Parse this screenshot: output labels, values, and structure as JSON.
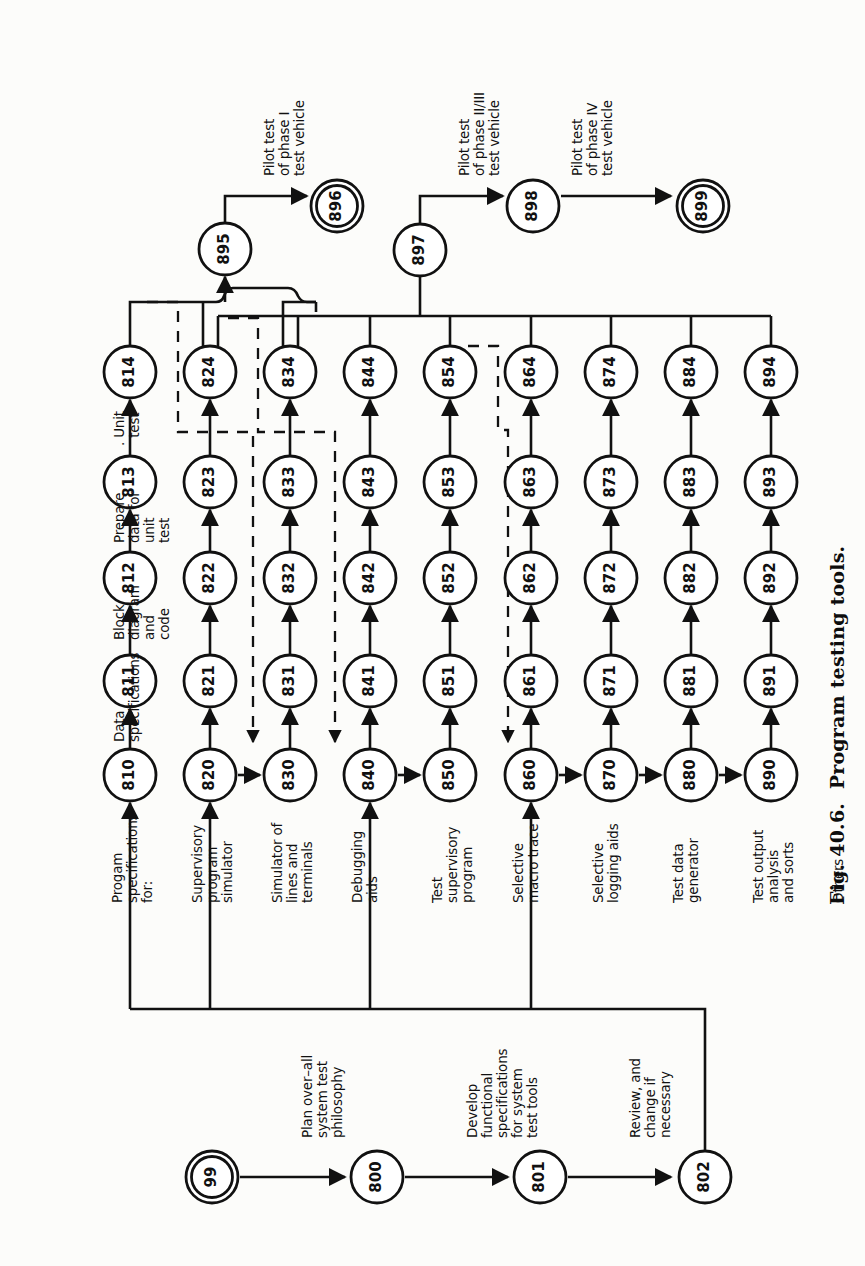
{
  "figure": {
    "caption": "Fig. 40.6.  Program testing tools.",
    "kind": "PERT network / activity-on-arrow diagram",
    "orientation": "rotated 90 degrees counter-clockwise on the page"
  },
  "colors": {
    "ink": "#111111",
    "paper": "#fcfcfa",
    "line": "#111111",
    "dashed": "#111111"
  },
  "nodes": [
    {
      "id": "99",
      "label": "99",
      "x": 212,
      "y": 1177,
      "r": 26,
      "double": true
    },
    {
      "id": "800",
      "label": "800",
      "x": 377,
      "y": 1177,
      "r": 26,
      "double": false
    },
    {
      "id": "801",
      "label": "801",
      "x": 540,
      "y": 1177,
      "r": 26,
      "double": false
    },
    {
      "id": "802",
      "label": "802",
      "x": 705,
      "y": 1177,
      "r": 26,
      "double": false
    },
    {
      "id": "810",
      "label": "810",
      "x": 130,
      "y": 775,
      "r": 26,
      "double": false
    },
    {
      "id": "811",
      "label": "811",
      "x": 130,
      "y": 681,
      "r": 26,
      "double": false
    },
    {
      "id": "812",
      "label": "812",
      "x": 130,
      "y": 578,
      "r": 26,
      "double": false
    },
    {
      "id": "813",
      "label": "813",
      "x": 130,
      "y": 482,
      "r": 26,
      "double": false
    },
    {
      "id": "814",
      "label": "814",
      "x": 130,
      "y": 372,
      "r": 26,
      "double": false
    },
    {
      "id": "820",
      "label": "820",
      "x": 210,
      "y": 775,
      "r": 26,
      "double": false
    },
    {
      "id": "821",
      "label": "821",
      "x": 210,
      "y": 681,
      "r": 26,
      "double": false
    },
    {
      "id": "822",
      "label": "822",
      "x": 210,
      "y": 578,
      "r": 26,
      "double": false
    },
    {
      "id": "823",
      "label": "823",
      "x": 210,
      "y": 482,
      "r": 26,
      "double": false
    },
    {
      "id": "824",
      "label": "824",
      "x": 210,
      "y": 372,
      "r": 26,
      "double": false
    },
    {
      "id": "830",
      "label": "830",
      "x": 290,
      "y": 775,
      "r": 26,
      "double": false
    },
    {
      "id": "831",
      "label": "831",
      "x": 290,
      "y": 681,
      "r": 26,
      "double": false
    },
    {
      "id": "832",
      "label": "832",
      "x": 290,
      "y": 578,
      "r": 26,
      "double": false
    },
    {
      "id": "833",
      "label": "833",
      "x": 290,
      "y": 482,
      "r": 26,
      "double": false
    },
    {
      "id": "834",
      "label": "834",
      "x": 290,
      "y": 372,
      "r": 26,
      "double": false
    },
    {
      "id": "840",
      "label": "840",
      "x": 370,
      "y": 775,
      "r": 26,
      "double": false
    },
    {
      "id": "841",
      "label": "841",
      "x": 370,
      "y": 681,
      "r": 26,
      "double": false
    },
    {
      "id": "842",
      "label": "842",
      "x": 370,
      "y": 578,
      "r": 26,
      "double": false
    },
    {
      "id": "843",
      "label": "843",
      "x": 370,
      "y": 482,
      "r": 26,
      "double": false
    },
    {
      "id": "844",
      "label": "844",
      "x": 370,
      "y": 372,
      "r": 26,
      "double": false
    },
    {
      "id": "850",
      "label": "850",
      "x": 450,
      "y": 775,
      "r": 26,
      "double": false
    },
    {
      "id": "851",
      "label": "851",
      "x": 450,
      "y": 681,
      "r": 26,
      "double": false
    },
    {
      "id": "852",
      "label": "852",
      "x": 450,
      "y": 578,
      "r": 26,
      "double": false
    },
    {
      "id": "853",
      "label": "853",
      "x": 450,
      "y": 482,
      "r": 26,
      "double": false
    },
    {
      "id": "854",
      "label": "854",
      "x": 450,
      "y": 372,
      "r": 26,
      "double": false
    },
    {
      "id": "860",
      "label": "860",
      "x": 531,
      "y": 775,
      "r": 26,
      "double": false
    },
    {
      "id": "861",
      "label": "861",
      "x": 531,
      "y": 681,
      "r": 26,
      "double": false
    },
    {
      "id": "862",
      "label": "862",
      "x": 531,
      "y": 578,
      "r": 26,
      "double": false
    },
    {
      "id": "863",
      "label": "863",
      "x": 531,
      "y": 482,
      "r": 26,
      "double": false
    },
    {
      "id": "864",
      "label": "864",
      "x": 531,
      "y": 372,
      "r": 26,
      "double": false
    },
    {
      "id": "870",
      "label": "870",
      "x": 611,
      "y": 775,
      "r": 26,
      "double": false
    },
    {
      "id": "871",
      "label": "871",
      "x": 611,
      "y": 681,
      "r": 26,
      "double": false
    },
    {
      "id": "872",
      "label": "872",
      "x": 611,
      "y": 578,
      "r": 26,
      "double": false
    },
    {
      "id": "873",
      "label": "873",
      "x": 611,
      "y": 482,
      "r": 26,
      "double": false
    },
    {
      "id": "874",
      "label": "874",
      "x": 611,
      "y": 372,
      "r": 26,
      "double": false
    },
    {
      "id": "880",
      "label": "880",
      "x": 691,
      "y": 775,
      "r": 26,
      "double": false
    },
    {
      "id": "881",
      "label": "881",
      "x": 691,
      "y": 681,
      "r": 26,
      "double": false
    },
    {
      "id": "882",
      "label": "882",
      "x": 691,
      "y": 578,
      "r": 26,
      "double": false
    },
    {
      "id": "883",
      "label": "883",
      "x": 691,
      "y": 482,
      "r": 26,
      "double": false
    },
    {
      "id": "884",
      "label": "884",
      "x": 691,
      "y": 372,
      "r": 26,
      "double": false
    },
    {
      "id": "890",
      "label": "890",
      "x": 771,
      "y": 775,
      "r": 26,
      "double": false
    },
    {
      "id": "891",
      "label": "891",
      "x": 771,
      "y": 681,
      "r": 26,
      "double": false
    },
    {
      "id": "892",
      "label": "892",
      "x": 771,
      "y": 578,
      "r": 26,
      "double": false
    },
    {
      "id": "893",
      "label": "893",
      "x": 771,
      "y": 482,
      "r": 26,
      "double": false
    },
    {
      "id": "894",
      "label": "894",
      "x": 771,
      "y": 372,
      "r": 26,
      "double": false
    },
    {
      "id": "895",
      "label": "895",
      "x": 225,
      "y": 249,
      "r": 26,
      "double": false
    },
    {
      "id": "896",
      "label": "896",
      "x": 337,
      "y": 206,
      "r": 26,
      "double": true
    },
    {
      "id": "897",
      "label": "897",
      "x": 420,
      "y": 250,
      "r": 26,
      "double": false
    },
    {
      "id": "898",
      "label": "898",
      "x": 533,
      "y": 206,
      "r": 26,
      "double": false
    },
    {
      "id": "899",
      "label": "899",
      "x": 703,
      "y": 206,
      "r": 26,
      "double": true
    }
  ],
  "activity_labels": [
    {
      "id": "plan-philosophy",
      "text": "Plan over–all\nsystem test\nphilosophy",
      "x": 300,
      "y": 1138,
      "size": 13.5
    },
    {
      "id": "develop-specs",
      "text": "Develop\nfunctional\nspecifications\nfor system\ntest tools",
      "x": 465,
      "y": 1138,
      "size": 13.5
    },
    {
      "id": "review-change",
      "text": "Review, and\nchange if\nnecessary",
      "x": 628,
      "y": 1138,
      "size": 13.5
    },
    {
      "id": "prog-spec-for",
      "text": "Progam\nspecifications\nfor:",
      "x": 110,
      "y": 903,
      "size": 13.5
    },
    {
      "id": "supervisory-sim",
      "text": "Supervisory\nprogram\nsimulator",
      "x": 190,
      "y": 903,
      "size": 13.5
    },
    {
      "id": "simulator-lines",
      "text": "Simulator of\nlines and\nterminals",
      "x": 270,
      "y": 903,
      "size": 13.5
    },
    {
      "id": "debugging-aids",
      "text": "Debugging\naids",
      "x": 350,
      "y": 903,
      "size": 13.5
    },
    {
      "id": "test-supervisory",
      "text": "Test\nsupervisory\nprogram",
      "x": 430,
      "y": 903,
      "size": 13.5
    },
    {
      "id": "selective-macro",
      "text": "Selective\nmacro trace",
      "x": 511,
      "y": 903,
      "size": 13.5
    },
    {
      "id": "selective-log",
      "text": "Selective\nlogging aids",
      "x": 591,
      "y": 903,
      "size": 13.5
    },
    {
      "id": "test-data-gen",
      "text": "Test data\ngenerator",
      "x": 671,
      "y": 903,
      "size": 13.5
    },
    {
      "id": "test-output",
      "text": "Test output\nanalysis\nand sorts",
      "x": 751,
      "y": 903,
      "size": 13.5
    },
    {
      "id": "others",
      "text": "Others",
      "x": 831,
      "y": 903,
      "size": 13.5
    },
    {
      "id": "data-specs",
      "text": "Data\nspecifications",
      "x": 112,
      "y": 742,
      "size": 13.5
    },
    {
      "id": "block-diagram",
      "text": "Block\ndiagram\nand\ncode",
      "x": 112,
      "y": 640,
      "size": 13.5
    },
    {
      "id": "prepare-data",
      "text": "Prepare\ndata for\nunit\ntest",
      "x": 112,
      "y": 543,
      "size": 13.5
    },
    {
      "id": "unit-test",
      "text": ". Unit\n  test",
      "x": 112,
      "y": 446,
      "size": 13.5
    },
    {
      "id": "pilot-phase-1",
      "text": "Pilot test\nof phase I\ntest vehicle",
      "x": 262,
      "y": 176,
      "size": 13.5
    },
    {
      "id": "pilot-phase-23",
      "text": "Pilot test\nof phase II/III\ntest vehicle",
      "x": 457,
      "y": 176,
      "size": 13.5
    },
    {
      "id": "pilot-phase-4",
      "text": "Pilot test\nof phase IV\ntest vehicle",
      "x": 570,
      "y": 176,
      "size": 13.5
    }
  ],
  "edges": {
    "solid_chains": [
      [
        "99",
        "800"
      ],
      [
        "800",
        "801"
      ],
      [
        "801",
        "802"
      ],
      [
        "810",
        "811"
      ],
      [
        "811",
        "812"
      ],
      [
        "812",
        "813"
      ],
      [
        "813",
        "814"
      ],
      [
        "820",
        "821"
      ],
      [
        "821",
        "822"
      ],
      [
        "822",
        "823"
      ],
      [
        "823",
        "824"
      ],
      [
        "830",
        "831"
      ],
      [
        "831",
        "832"
      ],
      [
        "832",
        "833"
      ],
      [
        "833",
        "834"
      ],
      [
        "840",
        "841"
      ],
      [
        "841",
        "842"
      ],
      [
        "842",
        "843"
      ],
      [
        "843",
        "844"
      ],
      [
        "850",
        "851"
      ],
      [
        "851",
        "852"
      ],
      [
        "852",
        "853"
      ],
      [
        "853",
        "854"
      ],
      [
        "860",
        "861"
      ],
      [
        "861",
        "862"
      ],
      [
        "862",
        "863"
      ],
      [
        "863",
        "864"
      ],
      [
        "870",
        "871"
      ],
      [
        "871",
        "872"
      ],
      [
        "872",
        "873"
      ],
      [
        "873",
        "874"
      ],
      [
        "880",
        "881"
      ],
      [
        "881",
        "882"
      ],
      [
        "882",
        "883"
      ],
      [
        "883",
        "884"
      ],
      [
        "890",
        "891"
      ],
      [
        "891",
        "892"
      ],
      [
        "892",
        "893"
      ],
      [
        "893",
        "894"
      ],
      [
        "820",
        "830"
      ],
      [
        "840",
        "850"
      ],
      [
        "860",
        "870"
      ],
      [
        "870",
        "880"
      ],
      [
        "880",
        "890"
      ],
      [
        "895",
        "896"
      ],
      [
        "897",
        "898"
      ],
      [
        "898",
        "899"
      ]
    ],
    "dashed_dependencies": [
      {
        "from": "814",
        "to": "830",
        "note": "unit test of supervisory program simulator feeds debugging aids spec"
      },
      {
        "from": "824",
        "to": "840",
        "note": "unit test of line/terminal simulator feeds test supervisory program spec"
      },
      {
        "from": "854",
        "to": "860",
        "note": "unit test of selective macro trace feeds selective logging aids spec"
      }
    ],
    "bus_to_895": [
      "814",
      "824",
      "834"
    ],
    "bus_to_897": [
      "824",
      "834",
      "844",
      "854",
      "864",
      "874",
      "884",
      "894"
    ],
    "feeder_802": "802 feeds the 810/820/840/860 specification chain via the long bus"
  }
}
